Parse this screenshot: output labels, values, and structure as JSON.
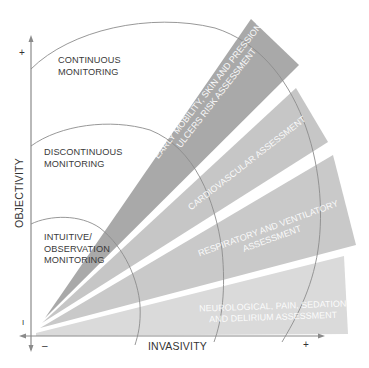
{
  "diagram": {
    "axes": {
      "y_label": "OBJECTIVITY",
      "x_label": "INVASIVITY",
      "y_plus": "+",
      "y_minus": "I",
      "x_minus": "–",
      "x_plus": "+"
    },
    "zones": [
      {
        "line1": "CONTINUOUS",
        "line2": "MONITORING"
      },
      {
        "line1": "DISCONTINUOUS",
        "line2": "MONITORING"
      },
      {
        "line1": "INTUITIVE/",
        "line2": "OBSERVATION",
        "line3": "MONITORING"
      }
    ],
    "wedges": [
      {
        "line1": "EARLY MOBILITY, SKIN AND PRESSION",
        "line2": "ULCERS RISK ASSESSMENT",
        "color": "#a9a9a9"
      },
      {
        "line1": "CARDIOVASCULAR ASSESSMENT",
        "color": "#c6c6c6"
      },
      {
        "line1": "RESPIRATORY AND VENTILATORY",
        "line2": "ASSESSMENT",
        "color": "#c9c9c9"
      },
      {
        "line1": "NEUROLOGICAL, PAIN, SEDATION",
        "line2": "AND DELIRIUM ASSESSMENT",
        "color": "#dadada"
      }
    ],
    "colors": {
      "axis": "#8a8a8a",
      "arc": "#8c8c8c",
      "text": "#3a3a3a"
    }
  }
}
